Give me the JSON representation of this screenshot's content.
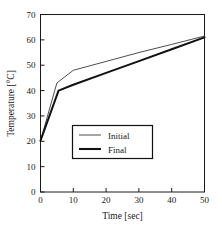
{
  "chart_data": {
    "type": "line",
    "title": "",
    "xlabel": "Time [sec]",
    "ylabel": "Temperature [°C]",
    "xlim": [
      0,
      50
    ],
    "ylim": [
      0,
      70
    ],
    "xticks": [
      0,
      10,
      20,
      30,
      40,
      50
    ],
    "yticks": [
      0,
      10,
      20,
      30,
      40,
      50,
      60,
      70
    ],
    "xtick_labels": [
      "0",
      "10",
      "20",
      "30",
      "40",
      "50"
    ],
    "ytick_labels": [
      "0",
      "10",
      "20",
      "30",
      "40",
      "50",
      "60",
      "70"
    ],
    "grid": false,
    "legend_position": "center-left inside plot",
    "series": [
      {
        "name": "Initial",
        "color": "#4d4d4d",
        "line_width": 1,
        "x": [
          0,
          5,
          10,
          20,
          30,
          40,
          50
        ],
        "values": [
          20.2,
          43.0,
          48.0,
          51.5,
          55.0,
          58.2,
          61.5
        ]
      },
      {
        "name": "Final",
        "color": "#111111",
        "line_width": 2,
        "x": [
          0,
          5.5,
          10,
          20,
          30,
          40,
          50
        ],
        "values": [
          20.2,
          40.0,
          42.3,
          47.0,
          51.6,
          56.3,
          61.0
        ]
      }
    ]
  },
  "legend": {
    "entries": [
      {
        "label": "Initial"
      },
      {
        "label": "Final"
      }
    ]
  },
  "axes": {
    "x_title": "Time [sec]",
    "y_title": "Temperature [°C]"
  },
  "colors": {
    "axis": "#1a1a1a",
    "background": "#ffffff",
    "initial_line": "#4d4d4d",
    "final_line": "#111111",
    "legend_border": "#111111"
  }
}
